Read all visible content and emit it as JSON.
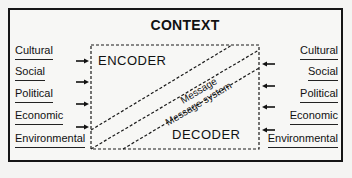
{
  "title": "CONTEXT",
  "encoder_label": "ENCODER",
  "decoder_label": "DECODER",
  "message_label": "Message",
  "message_system_label": "Message system",
  "left_factors": [
    "Cultural",
    "Social",
    "Political",
    "Economic",
    "Environmental"
  ],
  "right_factors": [
    "Cultural",
    "Social",
    "Political",
    "Economic",
    "Environmental"
  ],
  "arrows": {
    "left_direction": "right",
    "right_direction": "left",
    "count_per_side": 4
  },
  "colors": {
    "ink": "#151515",
    "background": "#f4f4f2"
  }
}
